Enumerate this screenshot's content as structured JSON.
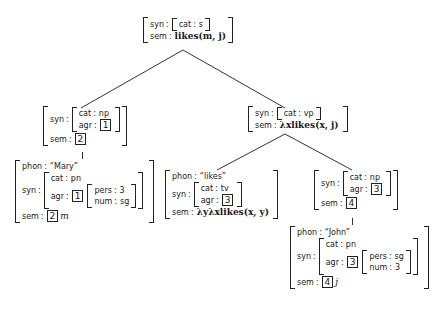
{
  "root": {
    "syn_label": "syn",
    "cat_label": "cat",
    "cat": "s",
    "sem_label": "sem",
    "sem": "likes(m, j)"
  },
  "np_subject": {
    "syn_label": "syn",
    "cat_label": "cat",
    "cat": "np",
    "agr_label": "agr",
    "agr_tag": "1",
    "sem_label": "sem",
    "sem_tag": "2"
  },
  "mary": {
    "phon_label": "phon",
    "phon": "“Mary”",
    "syn_label": "syn",
    "cat_label": "cat",
    "cat": "pn",
    "agr_label": "agr",
    "agr_tag": "1",
    "pers_label": "pers",
    "pers": "3",
    "num_label": "num",
    "num": "sg",
    "sem_label": "sem",
    "sem_tag": "2",
    "sem": "m"
  },
  "vp": {
    "syn_label": "syn",
    "cat_label": "cat",
    "cat": "vp",
    "sem_label": "sem",
    "sem": "λxlikes(x, j)"
  },
  "likes": {
    "phon_label": "phon",
    "phon": "“likes”",
    "syn_label": "syn",
    "cat_label": "cat",
    "cat": "tv",
    "agr_label": "agr",
    "agr_tag": "3",
    "sem_label": "sem",
    "sem": "λyλxlikes(x, y)"
  },
  "np_object": {
    "syn_label": "syn",
    "cat_label": "cat",
    "cat": "np",
    "agr_label": "agr",
    "agr_tag": "3",
    "sem_label": "sem",
    "sem_tag": "4"
  },
  "john": {
    "phon_label": "phon",
    "phon": "“John”",
    "syn_label": "syn",
    "cat_label": "cat",
    "cat": "pn",
    "agr_label": "agr",
    "agr_tag": "3",
    "pers_label": "pers",
    "pers": "sg",
    "num_label": "num",
    "num": "3",
    "sem_label": "sem",
    "sem_tag": "4",
    "sem": "j"
  },
  "colors": {
    "ink": "#1a1a1a",
    "background": "#ffffff"
  }
}
